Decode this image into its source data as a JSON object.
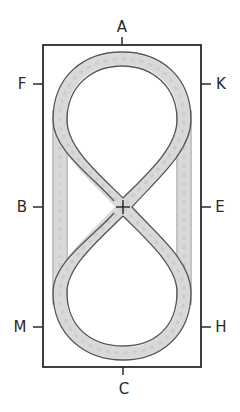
{
  "diagram": {
    "type": "dressage-arena-figure-eight",
    "arena": {
      "x": 43,
      "y": 45,
      "width": 158,
      "height": 322
    },
    "markers": [
      {
        "id": "A",
        "label": "A",
        "side": "top",
        "x": 122,
        "y": 45
      },
      {
        "id": "C",
        "label": "C",
        "side": "bottom",
        "x": 123,
        "y": 367
      },
      {
        "id": "F",
        "label": "F",
        "side": "left",
        "x": 43,
        "y": 84
      },
      {
        "id": "B",
        "label": "B",
        "side": "left",
        "x": 43,
        "y": 207
      },
      {
        "id": "M",
        "label": "M",
        "side": "left",
        "x": 43,
        "y": 327
      },
      {
        "id": "K",
        "label": "K",
        "side": "right",
        "x": 201,
        "y": 84
      },
      {
        "id": "E",
        "label": "E",
        "side": "right",
        "x": 201,
        "y": 207
      },
      {
        "id": "H",
        "label": "H",
        "side": "right",
        "x": 201,
        "y": 327
      }
    ],
    "center_point": {
      "label": "X",
      "x": 123,
      "y": 207,
      "shown_as": "cross"
    },
    "path_description": "Figure-eight track with two loops joined by diagonals crossing at center X, plus straight tracks along both long sides",
    "colors": {
      "border": "#2b2b2b",
      "track_fill": "#d9d9d9",
      "track_edge": "#555555",
      "background": "#ffffff"
    }
  }
}
